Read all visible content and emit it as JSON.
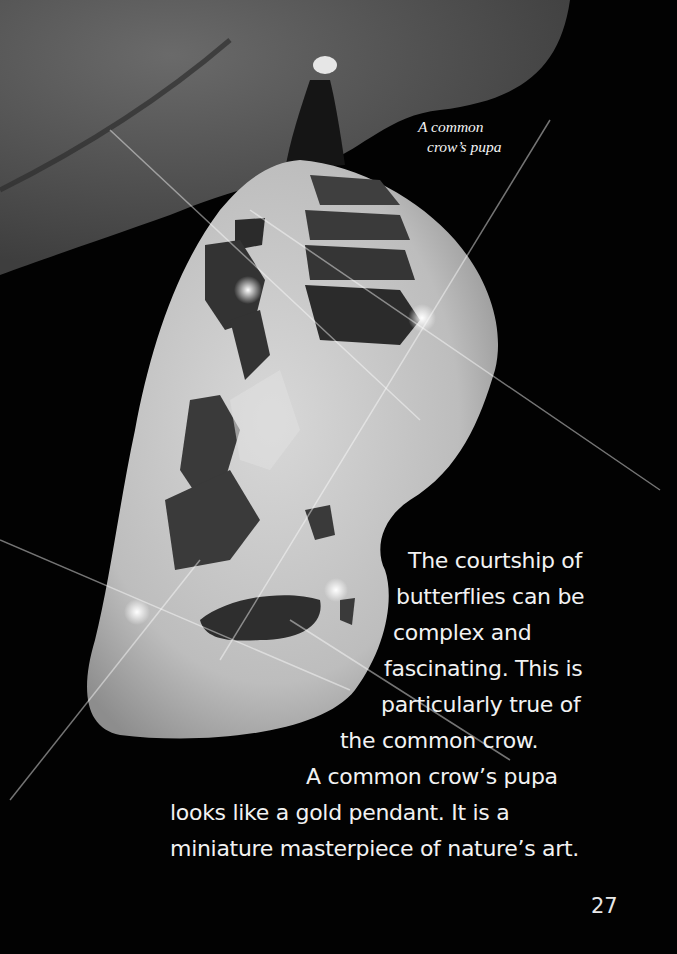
{
  "page": {
    "caption": [
      "A common",
      "crow’s pupa"
    ],
    "body_lines": [
      {
        "text": "The courtship of",
        "x": 408,
        "y": 548
      },
      {
        "text": "butterflies can be",
        "x": 396,
        "y": 584
      },
      {
        "text": "complex and",
        "x": 393,
        "y": 620
      },
      {
        "text": "fascinating.  This is",
        "x": 384,
        "y": 656
      },
      {
        "text": "particularly true of",
        "x": 381,
        "y": 692
      },
      {
        "text": "the common crow.",
        "x": 340,
        "y": 728
      },
      {
        "text": "A common crow’s pupa",
        "x": 306,
        "y": 764
      },
      {
        "text": "looks like a gold pendant.  It is a",
        "x": 170,
        "y": 800
      },
      {
        "text": "miniature masterpiece of nature’s art.",
        "x": 170,
        "y": 836
      }
    ],
    "page_number": "27",
    "colors": {
      "background": "#020202",
      "text": "#f2f2f2",
      "leaf": "#5a5a5a",
      "pupa": "#cfcfcf"
    }
  }
}
